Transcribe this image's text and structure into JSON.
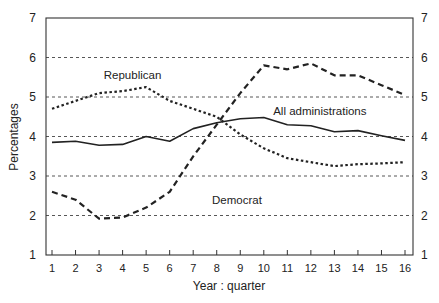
{
  "chart_data": {
    "type": "line",
    "title": "",
    "xlabel": "Year : quarter",
    "ylabel": "Percentages",
    "x": [
      1,
      2,
      3,
      4,
      5,
      6,
      7,
      8,
      9,
      10,
      11,
      12,
      13,
      14,
      15,
      16
    ],
    "xlim": [
      1,
      16
    ],
    "ylim": [
      1,
      7
    ],
    "yticks": [
      1,
      2,
      3,
      4,
      5,
      6,
      7
    ],
    "y_axis_right_mirrored": true,
    "grid": {
      "horizontal_dashed": [
        2,
        3,
        4,
        5,
        6
      ]
    },
    "legend": "inline labels",
    "series": [
      {
        "name": "Republican",
        "style": "dotted",
        "values": [
          4.7,
          4.9,
          5.1,
          5.15,
          5.25,
          4.9,
          4.7,
          4.5,
          4.05,
          3.7,
          3.45,
          3.35,
          3.25,
          3.3,
          3.32,
          3.35
        ]
      },
      {
        "name": "All administrations",
        "style": "solid",
        "values": [
          3.85,
          3.88,
          3.78,
          3.8,
          4.0,
          3.88,
          4.2,
          4.35,
          4.45,
          4.48,
          4.3,
          4.27,
          4.12,
          4.15,
          4.02,
          3.9
        ]
      },
      {
        "name": "Democrat",
        "style": "dashed",
        "values": [
          2.6,
          2.4,
          1.92,
          1.95,
          2.2,
          2.6,
          3.5,
          4.3,
          5.1,
          5.8,
          5.7,
          5.85,
          5.55,
          5.55,
          5.3,
          5.05
        ]
      }
    ],
    "annotations": [
      {
        "text": "Republican",
        "x": 3.2,
        "y": 5.45
      },
      {
        "text": "All administrations",
        "x": 10.4,
        "y": 4.55
      },
      {
        "text": "Democrat",
        "x": 7.8,
        "y": 2.3
      }
    ]
  }
}
